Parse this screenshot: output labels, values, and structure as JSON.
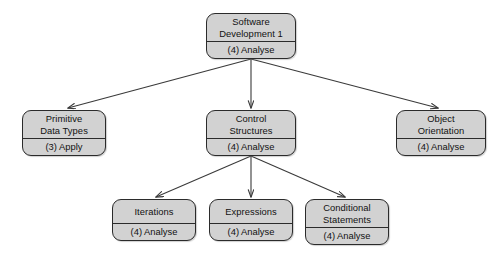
{
  "diagram": {
    "type": "tree",
    "background_color": "#ffffff",
    "node_fill_color": "#d2d2d2",
    "node_border_color": "#2b2b2b",
    "edge_color": "#3a3a3a",
    "nodes": [
      {
        "id": "software-development-1",
        "title_lines": [
          "Software",
          "Development 1"
        ],
        "level": "(4) Analyse",
        "x": 206,
        "y": 13,
        "width": 90,
        "height": 46
      },
      {
        "id": "primitive-data-types",
        "title_lines": [
          "Primitive",
          "Data Types"
        ],
        "level": "(3) Apply",
        "x": 22,
        "y": 110,
        "width": 84,
        "height": 46
      },
      {
        "id": "control-structures",
        "title_lines": [
          "Control",
          "Structures"
        ],
        "level": "(4) Analyse",
        "x": 206,
        "y": 110,
        "width": 90,
        "height": 46
      },
      {
        "id": "object-orientation",
        "title_lines": [
          "Object",
          "Orientation"
        ],
        "level": "(4) Analyse",
        "x": 396,
        "y": 110,
        "width": 90,
        "height": 46
      },
      {
        "id": "iterations",
        "title_lines": [
          "Iterations"
        ],
        "level": "(4) Analyse",
        "x": 112,
        "y": 199,
        "width": 84,
        "height": 42
      },
      {
        "id": "expressions",
        "title_lines": [
          "Expressions"
        ],
        "level": "(4) Analyse",
        "x": 209,
        "y": 199,
        "width": 84,
        "height": 42
      },
      {
        "id": "conditional-statements",
        "title_lines": [
          "Conditional",
          "Statements"
        ],
        "level": "(4) Analyse",
        "x": 305,
        "y": 199,
        "width": 84,
        "height": 46
      }
    ],
    "edges": [
      {
        "from": "software-development-1",
        "to": "primitive-data-types"
      },
      {
        "from": "software-development-1",
        "to": "control-structures"
      },
      {
        "from": "software-development-1",
        "to": "object-orientation"
      },
      {
        "from": "control-structures",
        "to": "iterations"
      },
      {
        "from": "control-structures",
        "to": "expressions"
      },
      {
        "from": "control-structures",
        "to": "conditional-statements"
      }
    ]
  }
}
